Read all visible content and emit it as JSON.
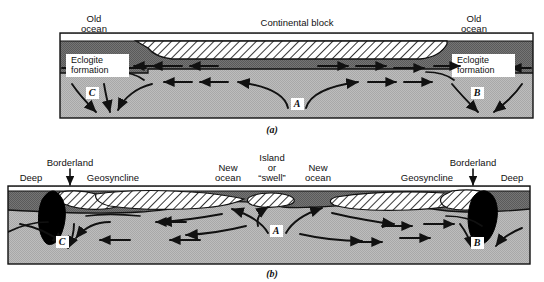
{
  "figure": {
    "kind": "geological-cross-section-diagram",
    "width": 544,
    "height": 282,
    "background_color": "#ffffff",
    "ink_color": "#111111"
  },
  "palette": {
    "ocean_water": "#ffffff",
    "upper_mantle_dark": "#6e6e6e",
    "lower_mantle_light": "#b6b6b6",
    "continental_block_fill": "#ffffff",
    "continental_block_hatch": "#111111",
    "deep_trench_fill": "#000000",
    "label_box_fill": "#ffffff",
    "outline": "#111111"
  },
  "panels": [
    {
      "id": "panel-a",
      "caption": "(a)",
      "frame": {
        "x": 60,
        "y": 33,
        "w": 473,
        "h": 85
      },
      "labels": [
        {
          "id": "old-ocean-left",
          "lines": [
            "Old",
            "ocean"
          ],
          "x": 94,
          "y": 14,
          "align": "middle"
        },
        {
          "id": "continental-block",
          "lines": [
            "Continental block"
          ],
          "x": 297,
          "y": 23,
          "align": "middle"
        },
        {
          "id": "old-ocean-right",
          "lines": [
            "Old",
            "ocean"
          ],
          "x": 474,
          "y": 14,
          "align": "middle"
        }
      ],
      "boxed_labels": [
        {
          "id": "eclogite-formation-left",
          "lines": [
            "Eclogite",
            "formation"
          ],
          "x": 66,
          "y": 54,
          "w": 63,
          "h": 23
        },
        {
          "id": "eclogite-formation-right",
          "lines": [
            "Eclogite",
            "formation"
          ],
          "x": 452,
          "y": 54,
          "w": 63,
          "h": 23
        }
      ],
      "point_labels": [
        {
          "id": "point-c",
          "text": "C",
          "x": 93,
          "y": 95
        },
        {
          "id": "point-a",
          "text": "A",
          "x": 298,
          "y": 106
        },
        {
          "id": "point-b",
          "text": "B",
          "x": 478,
          "y": 95
        }
      ]
    },
    {
      "id": "panel-b",
      "caption": "(b)",
      "frame": {
        "x": 8,
        "y": 186,
        "w": 522,
        "h": 78
      },
      "labels": [
        {
          "id": "deep-left",
          "lines": [
            "Deep"
          ],
          "x": 31,
          "y": 178,
          "align": "middle"
        },
        {
          "id": "borderland-left",
          "lines": [
            "Borderland"
          ],
          "x": 70,
          "y": 163,
          "align": "middle"
        },
        {
          "id": "geosyncline-left",
          "lines": [
            "Geosyncline"
          ],
          "x": 112,
          "y": 178,
          "align": "middle"
        },
        {
          "id": "new-ocean-left",
          "lines": [
            "New",
            "ocean"
          ],
          "x": 228,
          "y": 167,
          "align": "middle"
        },
        {
          "id": "island-or-swell",
          "lines": [
            "Island",
            "or",
            "“swell”"
          ],
          "x": 272,
          "y": 155,
          "align": "middle"
        },
        {
          "id": "new-ocean-right",
          "lines": [
            "New",
            "ocean"
          ],
          "x": 318,
          "y": 167,
          "align": "middle"
        },
        {
          "id": "geosyncline-right",
          "lines": [
            "Geosyncline"
          ],
          "x": 427,
          "y": 178,
          "align": "middle"
        },
        {
          "id": "borderland-right",
          "lines": [
            "Borderland"
          ],
          "x": 472,
          "y": 163,
          "align": "middle"
        },
        {
          "id": "deep-right",
          "lines": [
            "Deep"
          ],
          "x": 510,
          "y": 178,
          "align": "middle"
        }
      ],
      "pointer_arrows": [
        {
          "id": "borderland-pointer-left",
          "x": 70,
          "y1": 167,
          "y2": 185
        },
        {
          "id": "borderland-pointer-right",
          "x": 472,
          "y1": 167,
          "y2": 185
        }
      ],
      "point_labels": [
        {
          "id": "point-c",
          "text": "C",
          "x": 62,
          "y": 244
        },
        {
          "id": "point-a",
          "text": "A",
          "x": 276,
          "y": 233
        },
        {
          "id": "point-b",
          "text": "B",
          "x": 477,
          "y": 245
        }
      ]
    }
  ]
}
